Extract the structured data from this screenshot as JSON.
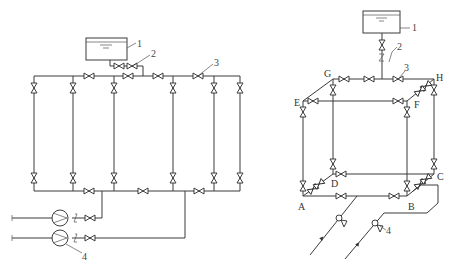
{
  "figure": {
    "left_diagram": {
      "description": "Parallel branch piping system supplied by two pumps with elevated tank",
      "callouts": [
        {
          "id": "1",
          "label": "1",
          "meaning": "tank"
        },
        {
          "id": "2",
          "label": "2",
          "meaning": "valve"
        },
        {
          "id": "3",
          "label": "3",
          "meaning": "valve"
        },
        {
          "id": "4",
          "label": "4",
          "meaning": "pump"
        }
      ]
    },
    "right_diagram": {
      "description": "Isometric ring piping network with elevated tank",
      "nodes": [
        "A",
        "B",
        "C",
        "D",
        "E",
        "F",
        "G",
        "H"
      ],
      "node_labels": {
        "A": "A",
        "B": "B",
        "C": "C",
        "D": "D",
        "E": "E",
        "F": "F",
        "G": "G",
        "H": "H"
      },
      "callouts": [
        {
          "id": "1",
          "label": "1",
          "meaning": "tank"
        },
        {
          "id": "2",
          "label": "2",
          "meaning": "check valve"
        },
        {
          "id": "3",
          "label": "3",
          "meaning": "valve"
        },
        {
          "id": "4",
          "label": "4",
          "meaning": "valve"
        }
      ]
    }
  },
  "colors": {
    "line": "#3a3a3a",
    "background": "#ffffff"
  }
}
